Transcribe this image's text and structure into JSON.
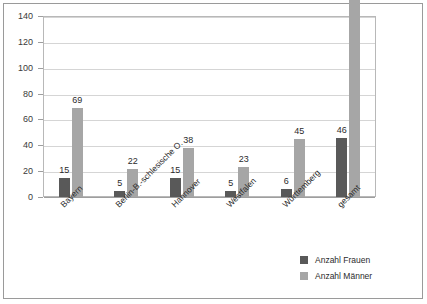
{
  "chart_data": {
    "type": "bar",
    "title": "",
    "xlabel": "",
    "ylabel": "",
    "ylim": [
      0,
      140
    ],
    "ytick_step": 20,
    "yticks": [
      0,
      20,
      40,
      60,
      80,
      100,
      120,
      140
    ],
    "grid": true,
    "legend_position": "bottom-right",
    "categories": [
      "Bayern",
      "Berlin-B.-schlesische O.",
      "Hannover",
      "Westfalen",
      "Württemberg",
      "gesamt"
    ],
    "series": [
      {
        "name": "Anzahl Frauen",
        "color": "#595959",
        "values": [
          15,
          5,
          15,
          5,
          6,
          46
        ]
      },
      {
        "name": "Anzahl Männer",
        "color": "#a6a6a6",
        "values": [
          69,
          22,
          38,
          23,
          45,
          197
        ]
      }
    ]
  },
  "legend": {
    "items": [
      {
        "label": "Anzahl Frauen",
        "color": "#595959"
      },
      {
        "label": "Anzahl Männer",
        "color": "#a6a6a6"
      }
    ]
  }
}
